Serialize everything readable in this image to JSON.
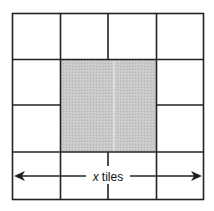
{
  "diagram": {
    "type": "tile-grid",
    "grid": {
      "cols": 4,
      "rows": 4
    },
    "center_region": {
      "description": "shaded square covering the middle 2×2 area",
      "fill": "#c4c4c4"
    },
    "stroke_color": "#222222",
    "measurement": {
      "variable": "x",
      "unit_label": "tiles",
      "direction": "horizontal, double-headed arrow across the full width"
    }
  }
}
